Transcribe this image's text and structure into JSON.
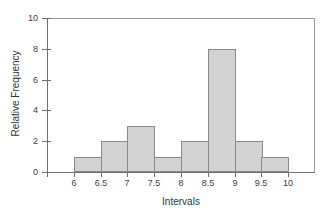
{
  "chart_data": {
    "type": "bar",
    "title": "",
    "subtitle": "",
    "xlabel": "Intervals",
    "ylabel": "Relative Frequency",
    "xlim": [
      5.5,
      10.5
    ],
    "ylim": [
      0,
      10
    ],
    "grid": false,
    "legend": null,
    "x_tick_labels": [
      "6",
      "6.5",
      "7",
      "7.5",
      "8",
      "8.5",
      "9",
      "9.5",
      "10"
    ],
    "x_tick_values": [
      6,
      6.5,
      7,
      7.5,
      8,
      8.5,
      9,
      9.5,
      10
    ],
    "y_tick_labels": [
      "0",
      "2",
      "4",
      "6",
      "8",
      "10"
    ],
    "y_tick_values": [
      0,
      2,
      4,
      6,
      8,
      10
    ],
    "bin_edges": [
      6,
      6.5,
      7,
      7.5,
      8,
      8.5,
      9,
      9.5,
      10
    ],
    "categories": [
      "6-6.5",
      "6.5-7",
      "7-7.5",
      "7.5-8",
      "8-8.5",
      "8.5-9",
      "9-9.5",
      "9.5-10"
    ],
    "values": [
      1,
      2,
      3,
      1,
      2,
      8,
      2,
      1
    ],
    "bar_fill_color": "#d2d2d2",
    "bar_edge_color": "#8a8a8a",
    "axis_color": "#6f6f6f",
    "frame_color": "#9a9a9a",
    "background_color": "#ffffff"
  }
}
